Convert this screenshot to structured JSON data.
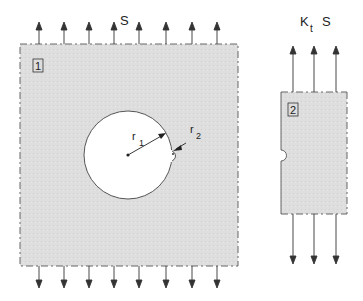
{
  "figure": {
    "plate1": {
      "id_label": "1",
      "load_label": "S",
      "hole_radius_label": "r",
      "hole_radius_sub": "1",
      "notch_radius_label": "r",
      "notch_radius_sub": "2",
      "arrow_count_top": 8,
      "arrow_count_bottom": 8
    },
    "plate2": {
      "id_label": "2",
      "load_label_main": "K",
      "load_label_sub": "t",
      "load_label_tail": "S",
      "arrow_count_top": 3,
      "arrow_count_bottom": 3
    },
    "colors": {
      "plate_fill": "#dcdcdc",
      "outline": "#555555",
      "hole_fill": "#ffffff",
      "arrow": "#333333"
    }
  }
}
